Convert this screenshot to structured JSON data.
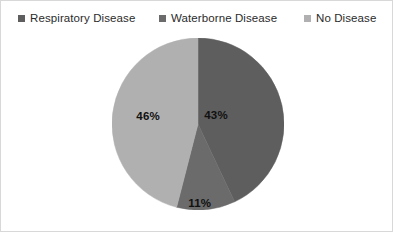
{
  "chart_data": {
    "type": "pie",
    "title": "",
    "categories": [
      "Respiratory Disease",
      "Waterborne Disease",
      "No Disease"
    ],
    "values": [
      43,
      11,
      46
    ],
    "value_labels": [
      "43%",
      "11%",
      "46%"
    ],
    "unit": "%",
    "total": 100,
    "start_angle_deg": 0,
    "direction": "clockwise",
    "legend_position": "top",
    "grid": false,
    "colors": [
      "#5e5e5e",
      "#6b6b6b",
      "#b0b0b0"
    ],
    "slices": [
      {
        "label": "Respiratory Disease",
        "value": 43,
        "display": "43%",
        "color": "#5e5e5e",
        "label_x_pct": 60.5,
        "label_y_pct": 44.5
      },
      {
        "label": "Waterborne Disease",
        "value": 11,
        "display": "11%",
        "color": "#6b6b6b",
        "label_x_pct": 51.0,
        "label_y_pct": 96.0
      },
      {
        "label": "No Disease",
        "value": 46,
        "display": "46%",
        "color": "#b0b0b0",
        "label_x_pct": 21.0,
        "label_y_pct": 45.5
      }
    ]
  },
  "legend": {
    "items": [
      {
        "label": "Respiratory Disease",
        "color": "#5e5e5e",
        "marker": "square-swatch"
      },
      {
        "label": "Waterborne Disease",
        "color": "#6b6b6b",
        "marker": "square-swatch"
      },
      {
        "label": "No Disease",
        "color": "#b0b0b0",
        "marker": "square-swatch"
      }
    ]
  },
  "canvas": {
    "background": "#ffffff",
    "border_color": "#d8d8d8"
  }
}
